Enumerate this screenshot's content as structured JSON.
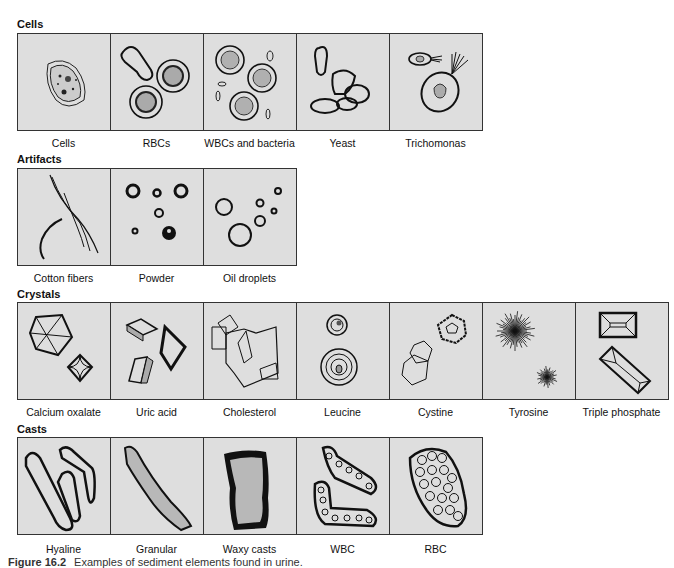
{
  "sections": [
    {
      "title": "Cells",
      "items": [
        "Cells",
        "RBCs",
        "WBCs and bacteria",
        "Yeast",
        "Trichomonas"
      ]
    },
    {
      "title": "Artifacts",
      "items": [
        "Cotton fibers",
        "Powder",
        "Oil droplets"
      ]
    },
    {
      "title": "Crystals",
      "items": [
        "Calcium oxalate",
        "Uric acid",
        "Cholesterol",
        "Leucine",
        "Cystine",
        "Tyrosine",
        "Triple phosphate"
      ]
    },
    {
      "title": "Casts",
      "items": [
        "Hyaline",
        "Granular",
        "Waxy casts",
        "WBC",
        "RBC"
      ]
    }
  ],
  "caption": {
    "label": "Figure 16.2",
    "text": "Examples of sediment elements found in urine."
  }
}
